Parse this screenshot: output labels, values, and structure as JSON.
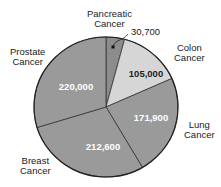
{
  "chart_data": {
    "type": "pie",
    "title": "",
    "start_angle_deg": 0,
    "direction": "clockwise",
    "categories": [
      "Pancreatic Cancer",
      "Colon Cancer",
      "Lung Cancer",
      "Breast Cancer",
      "Prostate Cancer"
    ],
    "values": [
      30700,
      105000,
      171900,
      212600,
      220000
    ],
    "value_labels": [
      "30,700",
      "105,000",
      "171,900",
      "212,600",
      "220,000"
    ],
    "colors": [
      "#8c8c8c",
      "#d6d6d6",
      "#9a9a9a",
      "#9a9a9a",
      "#9a9a9a"
    ],
    "labels": {
      "pancreatic": {
        "line1": "Pancreatic",
        "line2": "Cancer"
      },
      "colon": {
        "line1": "Colon",
        "line2": "Cancer"
      },
      "lung": {
        "line1": "Lung",
        "line2": "Cancer"
      },
      "breast": {
        "line1": "Breast",
        "line2": "Cancer"
      },
      "prostate": {
        "line1": "Prostate",
        "line2": "Cancer"
      }
    }
  }
}
